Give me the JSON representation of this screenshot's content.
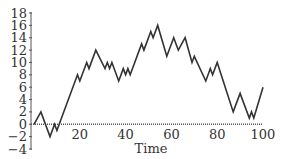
{
  "chart_data": {
    "type": "line",
    "title": "",
    "xlabel": "Time",
    "ylabel": "",
    "xlim": [
      0,
      100
    ],
    "ylim": [
      -4,
      18
    ],
    "grid": false,
    "legend": null,
    "x_ticks": [
      20,
      40,
      60,
      80,
      100
    ],
    "y_ticks": [
      -4,
      -2,
      0,
      2,
      4,
      6,
      8,
      10,
      12,
      14,
      16,
      18
    ],
    "series": [
      {
        "name": "random walk",
        "color": "#333333",
        "x": [
          0,
          3,
          7,
          9,
          10,
          19,
          20,
          23,
          24,
          27,
          31,
          32,
          33,
          34,
          37,
          39,
          40,
          41,
          42,
          47,
          48,
          49,
          51,
          52,
          54,
          58,
          61,
          63,
          66,
          69,
          70,
          75,
          77,
          78,
          80,
          87,
          90,
          94,
          95,
          96,
          100
        ],
        "y": [
          0,
          2,
          -2,
          0,
          -1,
          8,
          7,
          10,
          9,
          12,
          9,
          10,
          9,
          10,
          7,
          9,
          8,
          9,
          8,
          13,
          12,
          13,
          15,
          14,
          16,
          11,
          14,
          12,
          14,
          10,
          11,
          7,
          9,
          8,
          10,
          2,
          5,
          1,
          2,
          1,
          6
        ]
      }
    ]
  },
  "colors": {
    "line": "#333333",
    "axis": "#555555",
    "background": "#ffffff"
  }
}
